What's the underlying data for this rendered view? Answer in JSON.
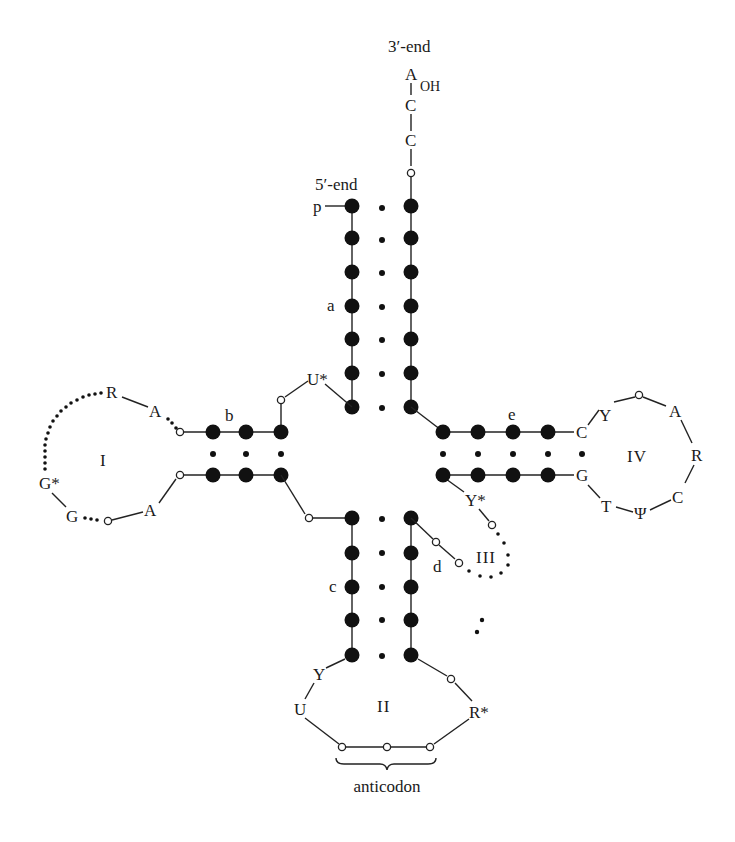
{
  "colors": {
    "ink": "#111111",
    "background": "#ffffff"
  },
  "labels": {
    "three_end": "3′-end",
    "five_end": "5′-end",
    "phosphate": "p",
    "terminal_A": "A",
    "terminal_OH": "OH",
    "cca_C1": "C",
    "cca_C2": "C",
    "stem_a": "a",
    "stem_b": "b",
    "stem_c": "c",
    "stem_d": "d",
    "stem_e": "e",
    "loop_I": "I",
    "loop_II": "II",
    "loop_III": "III",
    "loop_IV": "IV",
    "anticodon": "anticodon"
  },
  "acceptor_arm": {
    "stem_label": "a",
    "base_pairs": 7,
    "three_prime_tail": [
      "o",
      "C",
      "C",
      "A"
    ]
  },
  "junction": {
    "U_star": "U*",
    "connector": "o"
  },
  "d_arm": {
    "stem_label": "b",
    "base_pairs": 3,
    "loop_label": "I",
    "loop_bases": {
      "R": "R",
      "A_top": "A",
      "G_star": "G*",
      "G": "G",
      "A_bottom": "A"
    }
  },
  "anticodon_arm": {
    "stem_label": "c",
    "base_pairs": 5,
    "loop_label": "II",
    "loop_bases": {
      "Y": "Y",
      "U": "U",
      "R_star": "R*"
    },
    "anticodon_caption": "anticodon"
  },
  "variable_arm": {
    "stem_label": "d",
    "loop_label": "III",
    "Y_star": "Y*"
  },
  "t_arm": {
    "stem_label": "e",
    "base_pairs": 5,
    "loop_label": "IV",
    "loop_bases": {
      "C_stem": "C",
      "G_stem": "G",
      "Y": "Y",
      "A": "A",
      "R": "R",
      "C": "C",
      "Psi": "Ψ",
      "T": "T"
    }
  }
}
